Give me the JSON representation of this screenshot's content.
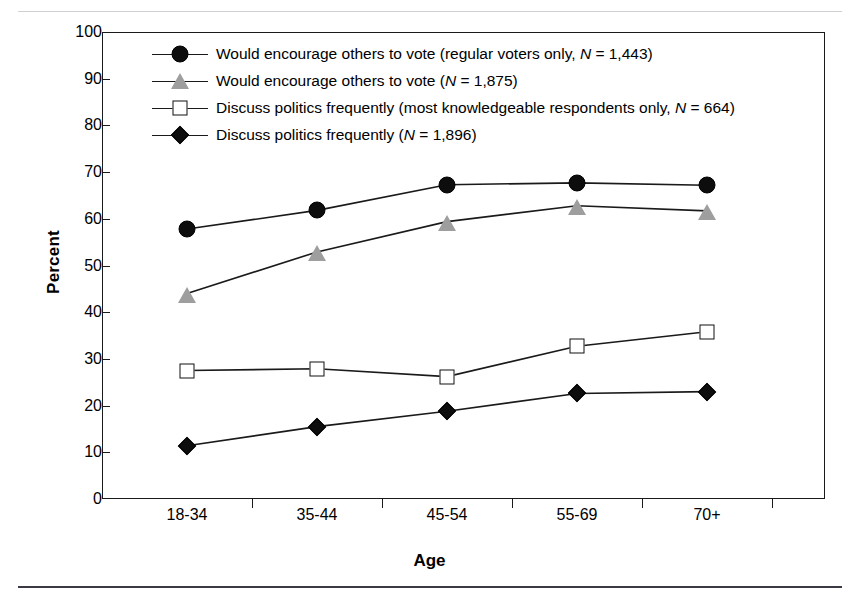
{
  "chart_data": {
    "type": "line",
    "title": "",
    "xlabel": "Age",
    "ylabel": "Percent",
    "ylim": [
      0,
      100
    ],
    "ytick_step": 10,
    "yticks": [
      "0",
      "10",
      "20",
      "30",
      "40",
      "50",
      "60",
      "70",
      "80",
      "90",
      "100"
    ],
    "categories": [
      "18-34",
      "35-44",
      "45-54",
      "55-69",
      "70+"
    ],
    "grid": false,
    "legend_position": "upper-left inside plot",
    "series": [
      {
        "name": "Would encourage others to vote (regular voters only, N = 1,443)",
        "label_main": "Would encourage others to vote (regular voters only, ",
        "label_italic": "N",
        "label_tail": " = 1,443)",
        "marker": "circle-filled-black",
        "color": "#0d0d0d",
        "values": [
          57.8,
          61.8,
          67.3,
          67.7,
          67.2
        ]
      },
      {
        "name": "Would encourage others to vote (N = 1,875)",
        "label_main": "Would encourage others to vote (",
        "label_italic": "N",
        "label_tail": " = 1,875)",
        "marker": "triangle-gray",
        "color": "#9e9e9e",
        "values": [
          44.0,
          52.9,
          59.4,
          62.8,
          61.7
        ]
      },
      {
        "name": "Discuss politics frequently (most knowledgeable respondents only, N = 664)",
        "label_main": "Discuss politics frequently (most knowledgeable respondents only, ",
        "label_italic": "N",
        "label_tail": " = 664)",
        "marker": "square-open-white",
        "color": "#ffffff",
        "values": [
          27.5,
          27.9,
          26.2,
          32.7,
          35.8
        ]
      },
      {
        "name": "Discuss politics frequently (N = 1,896)",
        "label_main": "Discuss politics frequently (",
        "label_italic": "N",
        "label_tail": " = 1,896)",
        "marker": "diamond-filled-black",
        "color": "#0d0d0d",
        "values": [
          11.4,
          15.5,
          18.8,
          22.6,
          23.0
        ]
      }
    ]
  }
}
